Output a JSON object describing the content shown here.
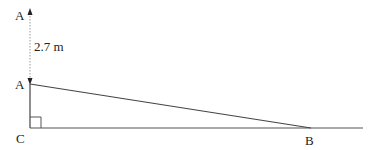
{
  "diagram": {
    "points": {
      "A_top": {
        "label": "A",
        "x": 30,
        "y": 11
      },
      "A": {
        "label": "A",
        "x": 30,
        "y": 84
      },
      "C": {
        "label": "C",
        "x": 30,
        "y": 128
      },
      "B": {
        "label": "B",
        "x": 311,
        "y": 128
      }
    },
    "measurement": {
      "label": "2.7 m",
      "between": [
        "A_top",
        "A"
      ]
    },
    "right_angle_at": "C",
    "colors": {
      "line": "#444444",
      "dotted": "#999999",
      "text": "#222222"
    }
  }
}
